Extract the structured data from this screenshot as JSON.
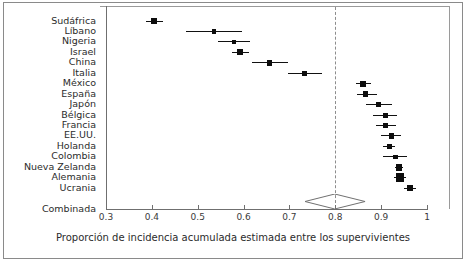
{
  "figure": {
    "x_axis_title": "Proporción de incidencia acumulada estimada entre los supervivientes",
    "summary_row_label": "Combinada"
  },
  "chart_data": {
    "type": "scatter",
    "subtype": "forest-plot",
    "title": "",
    "xlabel": "Proporción de incidencia acumulada estimada entre los supervivientes",
    "ylabel": "",
    "xlim": [
      0.3,
      1.0
    ],
    "xticks": [
      0.3,
      0.4,
      0.5,
      0.6,
      0.7,
      0.8,
      0.9,
      1.0
    ],
    "xtick_labels": [
      "0.3",
      "0.4",
      "0.5",
      "0.6",
      "0.7",
      "0.8",
      "0.9",
      "1"
    ],
    "grid": false,
    "legend": "none",
    "reference_line": 0.8,
    "reference_line_style": "dashed",
    "categories": [
      "Sudáfrica",
      "Líbano",
      "Nigeria",
      "Israel",
      "China",
      "Italia",
      "México",
      "España",
      "Japón",
      "Bélgica",
      "Francia",
      "EE.UU.",
      "Holanda",
      "Colombia",
      "Nueva Zelanda",
      "Alemania",
      "Ucrania"
    ],
    "studies": [
      {
        "label": "Sudáfrica",
        "estimate": 0.405,
        "ci_low": 0.387,
        "ci_high": 0.425,
        "weight": 2.2
      },
      {
        "label": "Líbano",
        "estimate": 0.535,
        "ci_low": 0.475,
        "ci_high": 0.596,
        "weight": 1.3
      },
      {
        "label": "Nigeria",
        "estimate": 0.579,
        "ci_low": 0.545,
        "ci_high": 0.614,
        "weight": 1.4
      },
      {
        "label": "Israel",
        "estimate": 0.593,
        "ci_low": 0.575,
        "ci_high": 0.611,
        "weight": 2.4
      },
      {
        "label": "China",
        "estimate": 0.657,
        "ci_low": 0.618,
        "ci_high": 0.697,
        "weight": 2.0
      },
      {
        "label": "Italia",
        "estimate": 0.733,
        "ci_low": 0.697,
        "ci_high": 0.772,
        "weight": 1.9
      },
      {
        "label": "México",
        "estimate": 0.861,
        "ci_low": 0.845,
        "ci_high": 0.879,
        "weight": 2.6
      },
      {
        "label": "España",
        "estimate": 0.866,
        "ci_low": 0.848,
        "ci_high": 0.892,
        "weight": 2.2
      },
      {
        "label": "Japón",
        "estimate": 0.895,
        "ci_low": 0.866,
        "ci_high": 0.923,
        "weight": 1.7
      },
      {
        "label": "Bélgica",
        "estimate": 0.909,
        "ci_low": 0.883,
        "ci_high": 0.935,
        "weight": 1.7
      },
      {
        "label": "Francia",
        "estimate": 0.91,
        "ci_low": 0.888,
        "ci_high": 0.933,
        "weight": 1.9
      },
      {
        "label": "EE.UU.",
        "estimate": 0.922,
        "ci_low": 0.899,
        "ci_high": 0.944,
        "weight": 1.9
      },
      {
        "label": "Holanda",
        "estimate": 0.918,
        "ci_low": 0.905,
        "ci_high": 0.931,
        "weight": 1.8
      },
      {
        "label": "Colombia",
        "estimate": 0.931,
        "ci_low": 0.903,
        "ci_high": 0.957,
        "weight": 1.4
      },
      {
        "label": "Nueva Zelanda",
        "estimate": 0.939,
        "ci_low": 0.93,
        "ci_high": 0.948,
        "weight": 3.0
      },
      {
        "label": "Alemania",
        "estimate": 0.941,
        "ci_low": 0.927,
        "ci_high": 0.955,
        "weight": 4.4
      },
      {
        "label": "Ucrania",
        "estimate": 0.963,
        "ci_low": 0.95,
        "ci_high": 0.976,
        "weight": 2.4
      }
    ],
    "pooled": {
      "label": "Combinada",
      "estimate": 0.8,
      "ci_low": 0.735,
      "ci_high": 0.866,
      "shape": "diamond"
    }
  }
}
